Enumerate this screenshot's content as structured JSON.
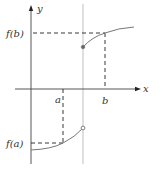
{
  "figure": {
    "type": "function-graph-discontinuity",
    "labels": {
      "y_axis": "y",
      "x_axis": "x",
      "a": "a",
      "b": "b",
      "f_a": "f(a)",
      "f_b": "f(b)"
    },
    "colors": {
      "axis": "#444444",
      "curve": "#777777",
      "dashed": "#222222",
      "vertical_line": "#aaaaaa",
      "text": "#333333"
    },
    "points": {
      "closed_dot": "filled endpoint of upper branch at discontinuity",
      "open_dot": "hollow endpoint of lower branch at discontinuity"
    }
  }
}
